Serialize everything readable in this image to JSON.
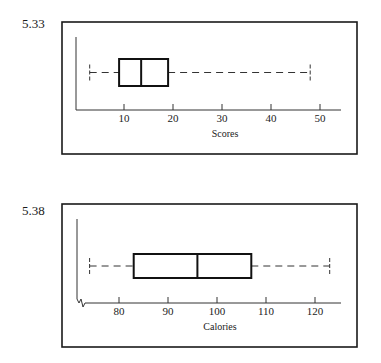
{
  "figures": [
    {
      "label": "5.33"
    },
    {
      "label": "5.38"
    }
  ],
  "chart_data": [
    {
      "type": "boxplot",
      "figure_label": "5.33",
      "title": "",
      "xlabel": "Scores",
      "ylabel": "",
      "xticks": [
        10,
        20,
        30,
        40,
        50
      ],
      "xtick_labels": [
        "10",
        "20",
        "30",
        "40",
        "50"
      ],
      "xlim": [
        0,
        54
      ],
      "grid": false,
      "axis_break": false,
      "box": {
        "min": 3,
        "q1": 9,
        "median": 13.5,
        "q3": 19,
        "max": 48
      },
      "whisker_style": "dashed"
    },
    {
      "type": "boxplot",
      "figure_label": "5.38",
      "title": "",
      "xlabel": "Calories",
      "ylabel": "",
      "xticks": [
        80,
        90,
        100,
        110,
        120
      ],
      "xtick_labels": [
        "80",
        "90",
        "100",
        "110",
        "120"
      ],
      "xlim": [
        71.5,
        125
      ],
      "grid": false,
      "axis_break": true,
      "box": {
        "min": 74,
        "q1": 83,
        "median": 96,
        "q3": 107,
        "max": 123
      },
      "whisker_style": "dashed"
    }
  ]
}
